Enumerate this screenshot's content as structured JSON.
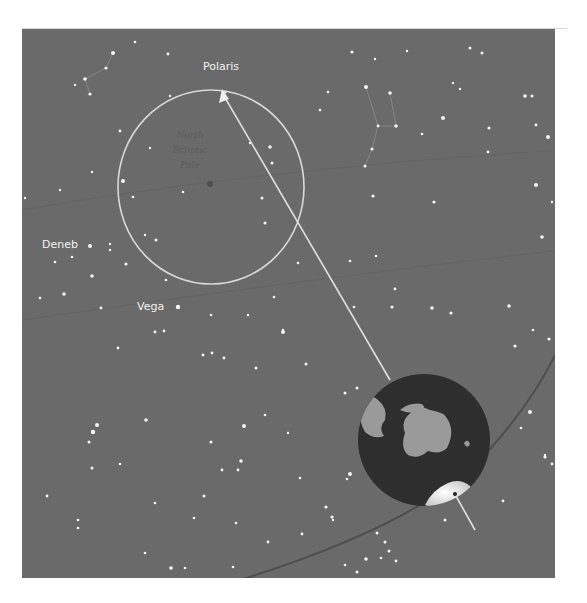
{
  "diagram": {
    "colors": {
      "sky": "#6a6a6a",
      "star": "#f4f4f4",
      "circle": "#d9d9d9",
      "arrow": "#e0e0e0",
      "earth_ocean": "#2e2e2e",
      "earth_land": "#9a9a9a",
      "orbit": "#4a4a4a",
      "constellation_line": "#8c8c8c"
    },
    "labels": {
      "polaris": "Polaris",
      "deneb": "Deneb",
      "vega": "Vega",
      "pole_line1": "North",
      "pole_line2": "Ecliptic",
      "pole_line3": "Pole"
    },
    "elements": {
      "precession_circle": {
        "cx": 211,
        "cy": 187,
        "rx": 93,
        "ry": 97
      },
      "earth": {
        "cx": 424,
        "cy": 440,
        "r": 66
      },
      "axis_arrow": {
        "from": [
          472,
          532
        ],
        "to": [
          222,
          90
        ]
      }
    }
  }
}
